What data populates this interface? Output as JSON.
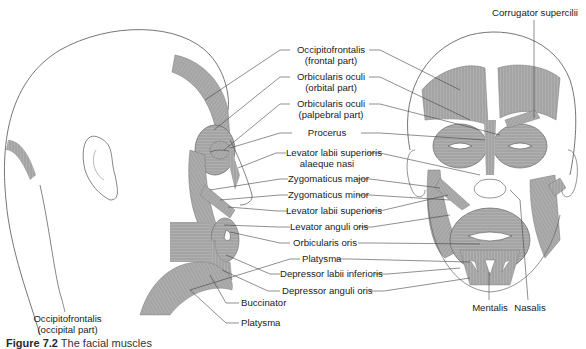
{
  "figure": {
    "caption_prefix": "Figure 7.2",
    "caption_text": "The facial muscles"
  },
  "views": {
    "lateral": "side-view-head",
    "anterior": "front-view-face"
  },
  "colors": {
    "muscle_fill": "#a8a8a8",
    "muscle_stripe": "#8a8a8a",
    "outline": "#555555",
    "leader_line": "#444444",
    "text": "#222222"
  },
  "labels": {
    "occipitofrontalis_frontal_1": "Occipitofrontalis",
    "occipitofrontalis_frontal_2": "(frontal part)",
    "orbicularis_oculi_orbital_1": "Orbicularis oculi",
    "orbicularis_oculi_orbital_2": "(orbital part)",
    "orbicularis_oculi_palpebral_1": "Orbicularis oculi",
    "orbicularis_oculi_palpebral_2": "(palpebral part)",
    "procerus": "Procerus",
    "levator_labii_alaeque_1": "Levator labii superioris",
    "levator_labii_alaeque_2": "alaeque nasi",
    "zygomaticus_major": "Zygomaticus major",
    "zygomaticus_minor": "Zygomaticus minor",
    "levator_labii_superioris": "Levator labii superioris",
    "levator_anguli_oris": "Levator anguli oris",
    "orbicularis_oris": "Orbicularis oris",
    "platysma_center": "Platysma",
    "depressor_labii_inferioris": "Depressor labii inferioris",
    "depressor_anguli_oris": "Depressor anguli oris",
    "buccinator": "Buccinator",
    "platysma_side": "Platysma",
    "occipitofrontalis_occipital_1": "Occipitofrontalis",
    "occipitofrontalis_occipital_2": "(occipital part)",
    "corrugator_supercilii": "Corrugator supercilii",
    "mentalis": "Mentalis",
    "nasalis": "Nasalis"
  }
}
